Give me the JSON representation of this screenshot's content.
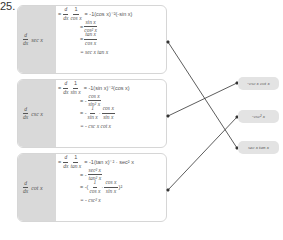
{
  "problem_number": "25.",
  "boxes": [
    {
      "lhs": {
        "d": "d",
        "dx": "dx",
        "func": "sec x"
      },
      "lines": [
        {
          "prefix": "=",
          "frac_n": "1",
          "frac_d": "cos x",
          "rest": "= -1(cos x)⁻²(-sin x)"
        },
        {
          "prefix": "=",
          "frac_n": "sin x",
          "frac_d": "cos² x"
        },
        {
          "prefix": "=",
          "frac_n": "tan x",
          "frac_d": "cos x"
        },
        {
          "prefix": "= sec x tan x"
        }
      ]
    },
    {
      "lhs": {
        "d": "d",
        "dx": "dx",
        "func": "csc x"
      },
      "lines": [
        {
          "prefix": "=",
          "frac_n": "1",
          "frac_d": "sin x",
          "rest": "= -1(sin x)⁻²(cos x)"
        },
        {
          "prefix": "= -",
          "frac_n": "cos x",
          "frac_d": "sin² x"
        },
        {
          "prefix": "= -",
          "frac_n": "1",
          "frac_d": "sin x",
          "mid": "·",
          "frac2_n": "cos x",
          "frac2_d": "sin x"
        },
        {
          "prefix": "= - csc x cot x"
        }
      ]
    },
    {
      "lhs": {
        "d": "d",
        "dx": "dx",
        "func": "cot x"
      },
      "lines": [
        {
          "prefix": "=",
          "frac_n": "1",
          "frac_d": "tan x",
          "rest": "= -1(tan x)⁻² · sec² x"
        },
        {
          "prefix": "= -",
          "frac_n": "sec² x",
          "frac_d": "tan² x"
        },
        {
          "prefix": "= -(",
          "frac_n": "1",
          "frac_d": "cos x",
          "mid": "·",
          "frac2_n": "cos x",
          "frac2_d": "sin x",
          "suffix": ")²"
        },
        {
          "prefix": "= - csc² x"
        }
      ]
    }
  ],
  "answers": [
    "-csc x cot x",
    "-csc² x",
    "sec x tan x"
  ],
  "matches": [
    {
      "from": "sec x",
      "to": "sec x tan x"
    },
    {
      "from": "csc x",
      "to": "-csc x cot x"
    },
    {
      "from": "cot x",
      "to": "-csc² x"
    }
  ],
  "colors": {
    "panel": "#d9d9d9",
    "border": "#d6d6d6",
    "pill": "#e3e3e3",
    "line": "#333333"
  }
}
